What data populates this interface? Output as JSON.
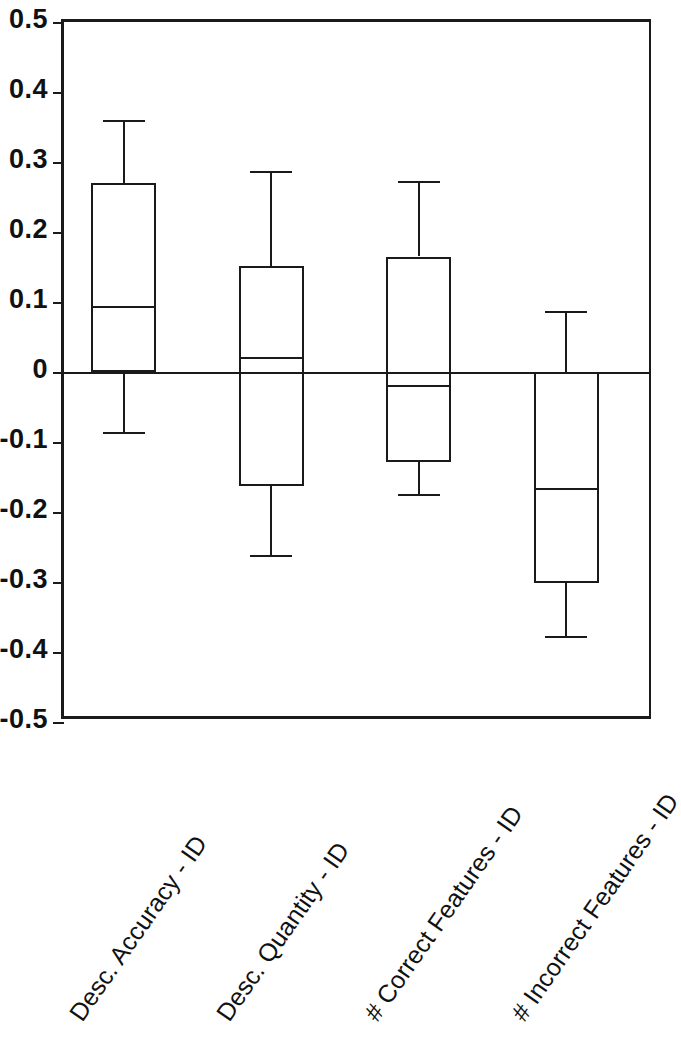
{
  "chart_data": {
    "type": "box",
    "title": "",
    "xlabel": "",
    "ylabel": "",
    "ylim": [
      -0.5,
      0.5
    ],
    "grid": false,
    "legend": null,
    "ytick_labels": [
      "0.5",
      "0.4",
      "0.3",
      "0.2",
      "0.1",
      "0",
      "-0.1",
      "-0.2",
      "-0.3",
      "-0.4",
      "-0.5"
    ],
    "ytick_values": [
      0.5,
      0.4,
      0.3,
      0.2,
      0.1,
      0,
      -0.1,
      -0.2,
      -0.3,
      -0.4,
      -0.5
    ],
    "categories": [
      "Desc. Accuracy - ID",
      "Desc. Quantity - ID",
      "# Correct Features - ID",
      "# Incorrect Features - ID"
    ],
    "boxes": [
      {
        "category": "Desc. Accuracy - ID",
        "whisker_high": 0.36,
        "q3": 0.27,
        "median": 0.095,
        "q1": 0.0,
        "whisker_low": -0.086
      },
      {
        "category": "Desc. Quantity - ID",
        "whisker_high": 0.287,
        "q3": 0.152,
        "median": 0.021,
        "q1": -0.163,
        "whisker_low": -0.262
      },
      {
        "category": "# Correct Features - ID",
        "whisker_high": 0.273,
        "q3": 0.165,
        "median": -0.018,
        "q1": -0.128,
        "whisker_low": -0.174
      },
      {
        "category": "# Incorrect Features - ID",
        "whisker_high": 0.087,
        "q3": 0.0,
        "median": -0.166,
        "q1": -0.301,
        "whisker_low": -0.377
      }
    ],
    "zero_reference_line": 0,
    "line_color": "#1a1a1a",
    "background_color": "#ffffff"
  }
}
